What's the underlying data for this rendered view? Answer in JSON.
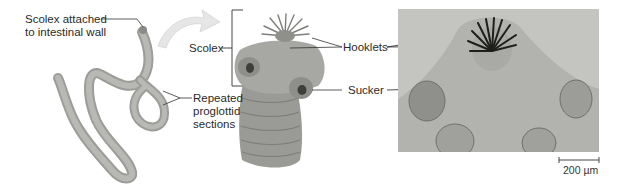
{
  "figure": {
    "panels": [
      {
        "id": "whole-worm",
        "labels": {
          "scolex_attached_line1": "Scolex attached",
          "scolex_attached_line2": "to intestinal wall",
          "proglottid_line1": "Repeated",
          "proglottid_line2": "proglottid",
          "proglottid_line3": "sections"
        }
      },
      {
        "id": "scolex-illustration",
        "labels": {
          "scolex": "Scolex",
          "hooklets": "Hooklets",
          "sucker": "Sucker"
        }
      },
      {
        "id": "micrograph",
        "scale_bar": {
          "label": "200 µm"
        }
      }
    ],
    "colors": {
      "worm_fill": "#a9aaa5",
      "worm_segment": "#8f908b",
      "scolex_fill": "#9d9e9a",
      "arrow_fill": "#e6e6e6",
      "photo_bg": "#bcbdb9",
      "leader_line": "#333333"
    }
  }
}
